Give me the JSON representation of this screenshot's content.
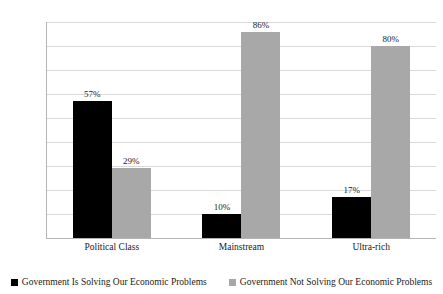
{
  "chart_data": {
    "type": "bar",
    "title": "",
    "xlabel": "",
    "ylabel": "",
    "ylim": [
      0,
      90
    ],
    "ytick_labels": [
      "90%",
      "80%",
      "70%",
      "60%",
      "50%",
      "40%",
      "30%",
      "20%",
      "10%",
      "0%"
    ],
    "ytick_values": [
      90,
      80,
      70,
      60,
      50,
      40,
      30,
      20,
      10,
      0
    ],
    "grid": true,
    "legend_position": "bottom",
    "categories": [
      "Political Class",
      "Mainstream",
      "Ultra-rich"
    ],
    "series": [
      {
        "name": "Government Is Solving Our Economic Problems",
        "color": "#000000",
        "values": [
          57,
          10,
          17
        ],
        "data_labels": [
          "57%",
          "10%",
          "17%"
        ]
      },
      {
        "name": "Government Not Solving Our Economic Problems",
        "color": "#a8a8a8",
        "values": [
          29,
          86,
          80
        ],
        "data_labels": [
          "29%",
          "86%",
          "80%"
        ]
      }
    ]
  },
  "legend": {
    "items": [
      {
        "label": "Government Is Solving Our Economic Problems",
        "marker": "square-black-icon"
      },
      {
        "label": "Government Not Solving Our Economic Problems",
        "marker": "square-gray-icon"
      }
    ]
  }
}
